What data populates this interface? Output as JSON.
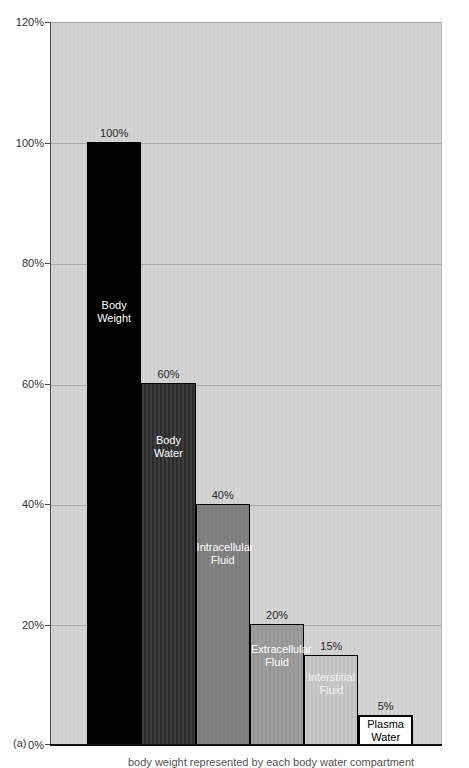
{
  "figure_label": "(a)",
  "caption_clipped": "body weight represented by each body water compartment",
  "y_axis": {
    "labels": [
      "120%",
      "100%",
      "80%",
      "60%",
      "40%",
      "20%",
      "0%"
    ]
  },
  "colors": {
    "plot_background": "#d2d2d2",
    "gridline": "#a9a9a9",
    "axis": "#111111"
  },
  "chart_data": {
    "type": "bar",
    "title": "",
    "xlabel": "",
    "ylabel": "",
    "ylim": [
      0,
      120
    ],
    "grid": true,
    "y_ticks": [
      "0%",
      "20%",
      "40%",
      "60%",
      "80%",
      "100%",
      "120%"
    ],
    "categories": [
      "Body Weight",
      "Body Water",
      "Intracellular Fluid",
      "Extracellular Fluid",
      "Interstitial Fluid",
      "Plasma Water"
    ],
    "values": [
      100,
      60,
      40,
      20,
      15,
      5
    ],
    "bars": [
      {
        "label": "Body\nWeight",
        "value": 100,
        "value_label": "100%",
        "color": "#000000",
        "stripe_color": "#000000",
        "striped": false,
        "text_color": "#ffffff"
      },
      {
        "label": "Body\nWater",
        "value": 60,
        "value_label": "60%",
        "color": "#3d3d3d",
        "stripe_color": "#2c2c2c",
        "striped": true,
        "text_color": "#ffffff"
      },
      {
        "label": "Intracellular\nFluid",
        "value": 40,
        "value_label": "40%",
        "color": "#848484",
        "stripe_color": "#7c7c7c",
        "striped": true,
        "text_color": "#ffffff"
      },
      {
        "label": "Extracellular\nFluid",
        "value": 20,
        "value_label": "20%",
        "color": "#9e9e9e",
        "stripe_color": "#969696",
        "striped": true,
        "text_color": "#ffffff"
      },
      {
        "label": "Interstitial\nFluid",
        "value": 15,
        "value_label": "15%",
        "color": "#cacaca",
        "stripe_color": "#c0c0c0",
        "striped": true,
        "text_color": "#f2f2f2"
      },
      {
        "label": "Plasma\nWater",
        "value": 5,
        "value_label": "5%",
        "color": "#ffffff",
        "stripe_color": "#ffffff",
        "striped": false,
        "text_color": "#000000"
      }
    ]
  }
}
